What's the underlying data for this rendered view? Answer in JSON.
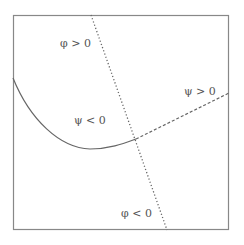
{
  "diagram": {
    "frame": {
      "x": 13,
      "y": 15,
      "width": 216,
      "height": 215,
      "stroke": "#888888"
    },
    "colors": {
      "line": "#666666",
      "text": "#555555"
    },
    "curves": {
      "psi_zero_solid": {
        "style": "solid",
        "path": "M13,78 C30,120 60,148 90,149 C110,149 125,143 136,139"
      },
      "psi_zero_dashed": {
        "style": "dashed",
        "from": [
          136,
          139
        ],
        "to": [
          229,
          93
        ]
      },
      "phi_zero_dotted": {
        "style": "dotted",
        "from": [
          91,
          15
        ],
        "to": [
          167,
          230
        ]
      }
    },
    "labels": {
      "phi_pos": "φ > 0",
      "psi_pos": "ψ > 0",
      "psi_neg": "ψ < 0",
      "phi_neg": "φ < 0"
    }
  }
}
